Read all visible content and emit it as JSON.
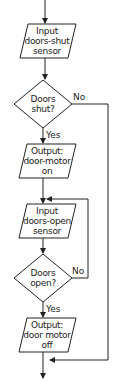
{
  "flowchart": {
    "nodes": [
      {
        "id": "input1",
        "type": "input-output",
        "lines": [
          "Input",
          "doors-shut",
          "sensor"
        ]
      },
      {
        "id": "decision1",
        "type": "decision",
        "lines": [
          "Doors",
          "shut?"
        ]
      },
      {
        "id": "output1",
        "type": "input-output",
        "lines": [
          "Output:",
          "door-motor",
          "on"
        ]
      },
      {
        "id": "input2",
        "type": "input-output",
        "lines": [
          "Input",
          "doors-open",
          "sensor"
        ]
      },
      {
        "id": "decision2",
        "type": "decision",
        "lines": [
          "Doors",
          "open?"
        ]
      },
      {
        "id": "output2",
        "type": "input-output",
        "lines": [
          "Output:",
          "door motor",
          "off"
        ]
      }
    ],
    "edges": [
      {
        "from": "start",
        "to": "input1",
        "label": ""
      },
      {
        "from": "input1",
        "to": "decision1",
        "label": ""
      },
      {
        "from": "decision1",
        "to": "output1",
        "label": "Yes"
      },
      {
        "from": "decision1",
        "to": "end",
        "label": "No"
      },
      {
        "from": "output1",
        "to": "input2",
        "label": ""
      },
      {
        "from": "input2",
        "to": "decision2",
        "label": ""
      },
      {
        "from": "decision2",
        "to": "output2",
        "label": "Yes"
      },
      {
        "from": "decision2",
        "to": "input2",
        "label": "No"
      },
      {
        "from": "output2",
        "to": "end",
        "label": ""
      }
    ]
  },
  "colors": {
    "stroke": "#222222",
    "background": "#ffffff"
  }
}
